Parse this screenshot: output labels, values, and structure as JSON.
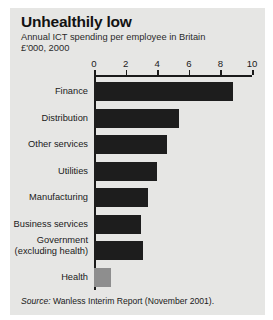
{
  "header": {
    "title": "Unhealthily low",
    "subtitle": "Annual ICT spending per employee in Britain\n£'000, 2000"
  },
  "source": {
    "label": "Source:",
    "text": " Wanless Interim Report (November 2001)."
  },
  "colors": {
    "panel_background": "#e6e6e4",
    "bar": "#1d1d1d",
    "bar_highlight": "#8e8e8e",
    "axis": "#1a1a1a",
    "text": "#1a1a1a"
  },
  "chart_data": {
    "type": "bar",
    "orientation": "horizontal",
    "title": "Unhealthily low",
    "subtitle": "Annual ICT spending per employee in Britain",
    "units": "£'000, 2000",
    "xlabel": "",
    "ylabel": "",
    "xlim": [
      0,
      10
    ],
    "xticks": [
      0,
      2,
      4,
      6,
      8,
      10
    ],
    "xticklabels": [
      "0",
      "2",
      "4",
      "6",
      "8",
      "10"
    ],
    "grid": false,
    "legend": false,
    "axis_position": "top",
    "categories": [
      "Finance",
      "Distribution",
      "Other services",
      "Utilities",
      "Manufacturing",
      "Business services",
      "Government\n(excluding health)",
      "Health"
    ],
    "values": [
      8.8,
      5.4,
      4.6,
      4.0,
      3.4,
      3.0,
      3.1,
      1.1
    ],
    "bar_colors": [
      "#1d1d1d",
      "#1d1d1d",
      "#1d1d1d",
      "#1d1d1d",
      "#1d1d1d",
      "#1d1d1d",
      "#1d1d1d",
      "#8e8e8e"
    ],
    "source": "Source: Wanless Interim Report (November 2001)."
  }
}
